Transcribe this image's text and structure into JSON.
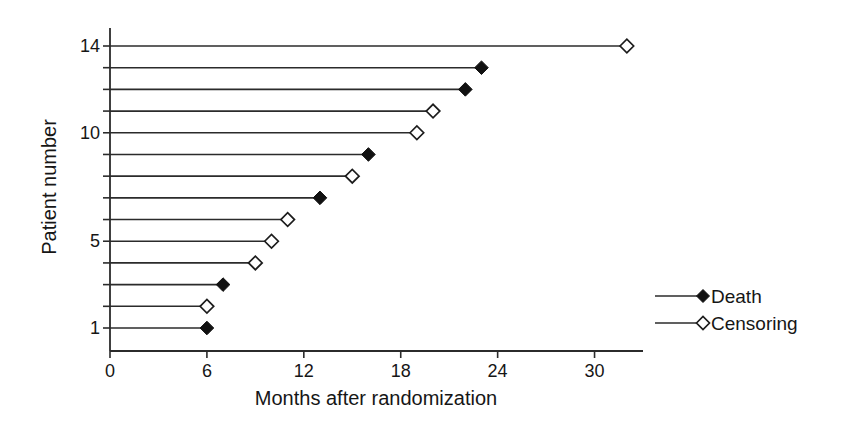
{
  "chart_data": {
    "type": "line",
    "subtype": "patient-event-timeline",
    "title": "",
    "xlabel": "Months after randomization",
    "ylabel": "Patient number",
    "xlim": [
      0,
      33
    ],
    "xticks": [
      0,
      6,
      12,
      18,
      24,
      30
    ],
    "yticks_labeled": [
      1,
      5,
      10,
      14
    ],
    "grid": false,
    "legend_position": "right",
    "patients": [
      {
        "patient": 1,
        "months": 6,
        "event": "death"
      },
      {
        "patient": 2,
        "months": 6,
        "event": "censoring"
      },
      {
        "patient": 3,
        "months": 7,
        "event": "death"
      },
      {
        "patient": 4,
        "months": 9,
        "event": "censoring"
      },
      {
        "patient": 5,
        "months": 10,
        "event": "censoring"
      },
      {
        "patient": 6,
        "months": 11,
        "event": "censoring"
      },
      {
        "patient": 7,
        "months": 13,
        "event": "death"
      },
      {
        "patient": 8,
        "months": 15,
        "event": "censoring"
      },
      {
        "patient": 9,
        "months": 16,
        "event": "death"
      },
      {
        "patient": 10,
        "months": 19,
        "event": "censoring"
      },
      {
        "patient": 11,
        "months": 20,
        "event": "censoring"
      },
      {
        "patient": 12,
        "months": 22,
        "event": "death"
      },
      {
        "patient": 13,
        "months": 23,
        "event": "death"
      },
      {
        "patient": 14,
        "months": 32,
        "event": "censoring"
      }
    ],
    "legend": [
      {
        "label": "Death",
        "marker": "filled-diamond"
      },
      {
        "label": "Censoring",
        "marker": "open-diamond"
      }
    ],
    "colors": {
      "line": "#2b2b2b",
      "marker_death_fill": "#111111",
      "marker_censoring_fill": "#ffffff",
      "text": "#161616",
      "background": "#ffffff"
    }
  }
}
